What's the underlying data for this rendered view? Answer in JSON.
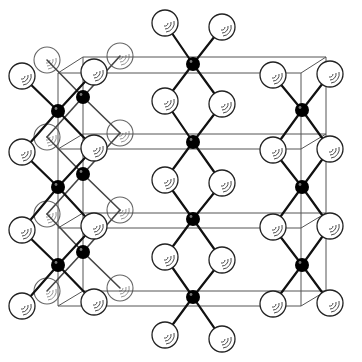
{
  "figure": {
    "title": "",
    "colors": {
      "background": "#ffffff",
      "frame": "#555555",
      "bond": "#111111",
      "black_atom": "#000000",
      "white_atom_fill": "#ffffff",
      "white_atom_stroke": "#222222"
    },
    "atom_radius": {
      "white": 13,
      "black": 7
    }
  },
  "frame": {
    "front_x": [
      58,
      301
    ],
    "back_x": [
      83,
      326
    ],
    "front_y": [
      73,
      149,
      228,
      306
    ],
    "back_y": [
      57,
      134,
      213,
      291
    ]
  },
  "atoms": {
    "black": [
      {
        "x": 193,
        "y": 64,
        "layer": "front"
      },
      {
        "x": 193,
        "y": 142,
        "layer": "front"
      },
      {
        "x": 193,
        "y": 219,
        "layer": "front"
      },
      {
        "x": 193,
        "y": 297,
        "layer": "front"
      },
      {
        "x": 302,
        "y": 110,
        "layer": "front"
      },
      {
        "x": 302,
        "y": 187,
        "layer": "front"
      },
      {
        "x": 302,
        "y": 265,
        "layer": "front"
      },
      {
        "x": 58,
        "y": 111,
        "layer": "front"
      },
      {
        "x": 58,
        "y": 187,
        "layer": "front"
      },
      {
        "x": 58,
        "y": 265,
        "layer": "front"
      },
      {
        "x": 83,
        "y": 97,
        "layer": "back"
      },
      {
        "x": 83,
        "y": 174,
        "layer": "back"
      },
      {
        "x": 83,
        "y": 252,
        "layer": "back"
      }
    ],
    "white": [
      {
        "x": 165,
        "y": 23,
        "layer": "front"
      },
      {
        "x": 222,
        "y": 27,
        "layer": "front"
      },
      {
        "x": 165,
        "y": 101,
        "layer": "front"
      },
      {
        "x": 222,
        "y": 104,
        "layer": "front"
      },
      {
        "x": 165,
        "y": 180,
        "layer": "front"
      },
      {
        "x": 222,
        "y": 183,
        "layer": "front"
      },
      {
        "x": 165,
        "y": 257,
        "layer": "front"
      },
      {
        "x": 222,
        "y": 260,
        "layer": "front"
      },
      {
        "x": 165,
        "y": 335,
        "layer": "front"
      },
      {
        "x": 222,
        "y": 339,
        "layer": "front"
      },
      {
        "x": 273,
        "y": 75,
        "layer": "front"
      },
      {
        "x": 330,
        "y": 74,
        "layer": "front"
      },
      {
        "x": 273,
        "y": 150,
        "layer": "front"
      },
      {
        "x": 330,
        "y": 149,
        "layer": "front"
      },
      {
        "x": 273,
        "y": 227,
        "layer": "front"
      },
      {
        "x": 330,
        "y": 226,
        "layer": "front"
      },
      {
        "x": 273,
        "y": 304,
        "layer": "front"
      },
      {
        "x": 330,
        "y": 303,
        "layer": "front"
      },
      {
        "x": 22,
        "y": 76,
        "layer": "front"
      },
      {
        "x": 94,
        "y": 72,
        "layer": "front"
      },
      {
        "x": 22,
        "y": 152,
        "layer": "front"
      },
      {
        "x": 94,
        "y": 148,
        "layer": "front"
      },
      {
        "x": 22,
        "y": 230,
        "layer": "front"
      },
      {
        "x": 94,
        "y": 226,
        "layer": "front"
      },
      {
        "x": 22,
        "y": 306,
        "layer": "front"
      },
      {
        "x": 94,
        "y": 302,
        "layer": "front"
      },
      {
        "x": 47,
        "y": 60,
        "layer": "back"
      },
      {
        "x": 120,
        "y": 56,
        "layer": "back"
      },
      {
        "x": 47,
        "y": 137,
        "layer": "back"
      },
      {
        "x": 120,
        "y": 133,
        "layer": "back"
      },
      {
        "x": 47,
        "y": 214,
        "layer": "back"
      },
      {
        "x": 120,
        "y": 210,
        "layer": "back"
      },
      {
        "x": 47,
        "y": 291,
        "layer": "back"
      },
      {
        "x": 120,
        "y": 288,
        "layer": "back"
      }
    ]
  },
  "bonds": [
    [
      193,
      64,
      165,
      23
    ],
    [
      193,
      64,
      222,
      27
    ],
    [
      193,
      64,
      165,
      101
    ],
    [
      193,
      64,
      222,
      104
    ],
    [
      193,
      142,
      165,
      101
    ],
    [
      193,
      142,
      222,
      104
    ],
    [
      193,
      142,
      165,
      180
    ],
    [
      193,
      142,
      222,
      183
    ],
    [
      193,
      219,
      165,
      180
    ],
    [
      193,
      219,
      222,
      183
    ],
    [
      193,
      219,
      165,
      257
    ],
    [
      193,
      219,
      222,
      260
    ],
    [
      193,
      297,
      165,
      257
    ],
    [
      193,
      297,
      222,
      260
    ],
    [
      193,
      297,
      165,
      335
    ],
    [
      193,
      297,
      222,
      339
    ],
    [
      302,
      110,
      273,
      75
    ],
    [
      302,
      110,
      330,
      74
    ],
    [
      302,
      110,
      273,
      150
    ],
    [
      302,
      110,
      330,
      149
    ],
    [
      302,
      187,
      273,
      150
    ],
    [
      302,
      187,
      330,
      149
    ],
    [
      302,
      187,
      273,
      227
    ],
    [
      302,
      187,
      330,
      226
    ],
    [
      302,
      265,
      273,
      227
    ],
    [
      302,
      265,
      330,
      226
    ],
    [
      302,
      265,
      273,
      304
    ],
    [
      302,
      265,
      330,
      303
    ],
    [
      58,
      111,
      22,
      76
    ],
    [
      58,
      111,
      94,
      72
    ],
    [
      58,
      111,
      22,
      152
    ],
    [
      58,
      111,
      94,
      148
    ],
    [
      58,
      187,
      22,
      152
    ],
    [
      58,
      187,
      94,
      148
    ],
    [
      58,
      187,
      22,
      230
    ],
    [
      58,
      187,
      94,
      226
    ],
    [
      58,
      265,
      22,
      230
    ],
    [
      58,
      265,
      94,
      226
    ],
    [
      58,
      265,
      22,
      306
    ],
    [
      58,
      265,
      94,
      302
    ]
  ],
  "back_bonds": [
    [
      83,
      97,
      47,
      60
    ],
    [
      83,
      97,
      120,
      56
    ],
    [
      83,
      97,
      47,
      137
    ],
    [
      83,
      97,
      120,
      133
    ],
    [
      83,
      174,
      47,
      137
    ],
    [
      83,
      174,
      120,
      133
    ],
    [
      83,
      174,
      47,
      214
    ],
    [
      83,
      174,
      120,
      210
    ],
    [
      83,
      252,
      47,
      214
    ],
    [
      83,
      252,
      120,
      210
    ],
    [
      83,
      252,
      47,
      291
    ],
    [
      83,
      252,
      120,
      288
    ]
  ]
}
